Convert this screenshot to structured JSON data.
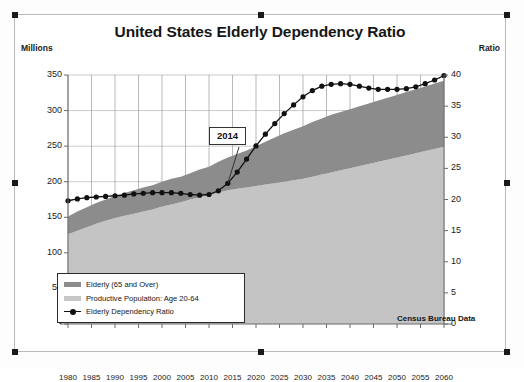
{
  "chart": {
    "title": "United States Elderly Dependency Ratio",
    "left_axis_caption": "Millions",
    "right_axis_caption": "Ratio",
    "source_note": "Census Bureau Data",
    "callout_label": "2014"
  },
  "legend": {
    "items": [
      {
        "label": "Elderly (65 and Over)",
        "marker": "area-swatch-dark",
        "color": "#8c8c8c"
      },
      {
        "label": "Productive Population: Age 20-64",
        "marker": "area-swatch-light",
        "color": "#c4c4c4"
      },
      {
        "label": "Elderly Dependency Ratio",
        "marker": "line-marker",
        "color": "#111111"
      }
    ]
  },
  "chart_data": {
    "type": "area",
    "title": "United States Elderly Dependency Ratio",
    "xlabel": "",
    "ylabel": "Millions",
    "y2label": "Ratio",
    "ylim": [
      0,
      350
    ],
    "y2lim": [
      0,
      40
    ],
    "yticks": [
      "-",
      "50",
      "100",
      "150",
      "200",
      "250",
      "300",
      "350"
    ],
    "ytick_values": [
      0,
      50,
      100,
      150,
      200,
      250,
      300,
      350
    ],
    "y2ticks": [
      "0",
      "5",
      "10",
      "15",
      "20",
      "25",
      "30",
      "35",
      "40"
    ],
    "y2tick_values": [
      0,
      5,
      10,
      15,
      20,
      25,
      30,
      35,
      40
    ],
    "grid": true,
    "legend_position": "lower-left",
    "annotations": [
      {
        "text": "2014",
        "x": 2014,
        "points_to_series": "Elderly Dependency Ratio"
      },
      {
        "text": "Census Bureau Data",
        "x": 2050,
        "position": "lower-right"
      }
    ],
    "categories": [
      1980,
      1982,
      1984,
      1986,
      1988,
      1990,
      1992,
      1994,
      1996,
      1998,
      2000,
      2002,
      2004,
      2006,
      2008,
      2010,
      2012,
      2014,
      2016,
      2018,
      2020,
      2022,
      2024,
      2026,
      2028,
      2030,
      2032,
      2034,
      2036,
      2038,
      2040,
      2042,
      2044,
      2046,
      2048,
      2050,
      2052,
      2054,
      2056,
      2058,
      2060
    ],
    "xtick_labels": [
      "1980",
      "1985",
      "1990",
      "1995",
      "2000",
      "2005",
      "2010",
      "2015",
      "2020",
      "2025",
      "2030",
      "2035",
      "2040",
      "2045",
      "2050",
      "2055",
      "2060"
    ],
    "series": [
      {
        "name": "Productive Population: Age 20-64",
        "axis": "left",
        "stack": "bottom",
        "color": "#c4c4c4",
        "values": [
          126,
          131,
          136,
          141,
          145,
          149,
          152,
          155,
          158,
          161,
          165,
          168,
          171,
          175,
          178,
          181,
          185,
          188,
          190,
          192,
          194,
          196,
          198,
          200,
          202,
          204,
          207,
          210,
          213,
          216,
          219,
          222,
          225,
          228,
          231,
          234,
          237,
          240,
          243,
          246,
          249
        ]
      },
      {
        "name": "Elderly (65 and Over)",
        "axis": "left",
        "stack": "top",
        "color": "#8c8c8c",
        "values": [
          25,
          27,
          28,
          29,
          30,
          31,
          32,
          33,
          34,
          34,
          35,
          36,
          36,
          37,
          39,
          40,
          43,
          46,
          49,
          52,
          56,
          60,
          64,
          68,
          71,
          74,
          77,
          79,
          81,
          82,
          83,
          84,
          85,
          86,
          87,
          88,
          89,
          90,
          91,
          92,
          93
        ]
      },
      {
        "name": "Elderly Dependency Ratio",
        "axis": "right",
        "type": "line-marker",
        "color": "#111111",
        "values": [
          19.8,
          20.1,
          20.3,
          20.4,
          20.5,
          20.6,
          20.7,
          20.9,
          21.0,
          21.1,
          21.1,
          21.1,
          21.0,
          20.8,
          20.7,
          20.8,
          21.4,
          22.6,
          24.4,
          26.5,
          28.6,
          30.5,
          32.2,
          33.8,
          35.2,
          36.5,
          37.5,
          38.2,
          38.5,
          38.6,
          38.5,
          38.2,
          37.9,
          37.7,
          37.7,
          37.7,
          37.8,
          38.1,
          38.6,
          39.2,
          39.9
        ]
      }
    ],
    "stacked_total": [
      151,
      158,
      164,
      170,
      175,
      180,
      184,
      188,
      192,
      195,
      200,
      204,
      207,
      212,
      217,
      221,
      228,
      234,
      239,
      244,
      250,
      256,
      262,
      268,
      273,
      278,
      284,
      289,
      294,
      298,
      302,
      306,
      310,
      314,
      318,
      322,
      326,
      330,
      334,
      338,
      342
    ]
  }
}
